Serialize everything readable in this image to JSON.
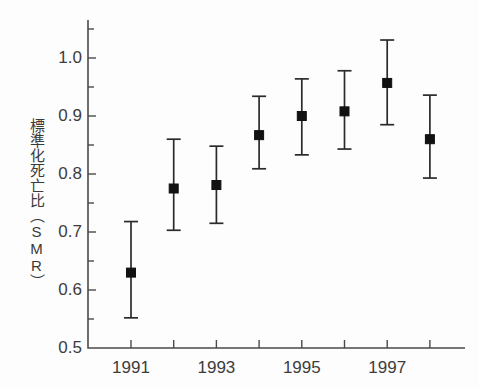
{
  "chart_data": {
    "type": "scatter",
    "title": "",
    "subtitle": "",
    "xlabel": "",
    "ylabel": "標準化死亡比（SMR）",
    "xlim": [
      1990.4,
      1998.8
    ],
    "ylim": [
      0.5,
      1.055
    ],
    "grid": false,
    "legend": null,
    "x": [
      1991,
      1992,
      1993,
      1994,
      1995,
      1996,
      1997,
      1998
    ],
    "categories": [
      "1991",
      "1992",
      "1993",
      "1994",
      "1995",
      "1996",
      "1997",
      "1998"
    ],
    "values": [
      0.63,
      0.775,
      0.781,
      0.867,
      0.9,
      0.908,
      0.957,
      0.86
    ],
    "error_low": [
      0.552,
      0.703,
      0.715,
      0.809,
      0.833,
      0.843,
      0.885,
      0.793
    ],
    "error_high": [
      0.718,
      0.86,
      0.848,
      0.934,
      0.964,
      0.978,
      1.031,
      0.936
    ],
    "series": [
      {
        "name": "SMR",
        "marker": "square",
        "color": "#111111",
        "values": [
          0.63,
          0.775,
          0.781,
          0.867,
          0.9,
          0.908,
          0.957,
          0.86
        ]
      }
    ],
    "y_ticks_major": [
      0.5,
      0.6,
      0.7,
      0.8,
      0.9,
      1.0
    ],
    "y_ticks_minor": [
      0.55,
      0.65,
      0.75,
      0.85,
      0.95,
      1.05
    ],
    "y_tick_labels": [
      "0.5",
      "0.6",
      "0.7",
      "0.8",
      "0.9",
      "1.0"
    ],
    "x_ticks": [
      1991,
      1992,
      1993,
      1994,
      1995,
      1996,
      1997,
      1998
    ],
    "x_tick_labels": [
      "1991",
      "",
      "1993",
      "",
      "1995",
      "",
      "1997",
      ""
    ],
    "x_labeled_ticks": [
      {
        "value": 1991,
        "label": "1991"
      },
      {
        "value": 1993,
        "label": "1993"
      },
      {
        "value": 1995,
        "label": "1995"
      },
      {
        "value": 1997,
        "label": "1997"
      }
    ],
    "colors": {
      "marker": "#111111",
      "errorbar": "#2b2b2b",
      "axis": "#4a4a4a",
      "text": "#3c3c3c",
      "background": "#fdfdfd"
    }
  }
}
